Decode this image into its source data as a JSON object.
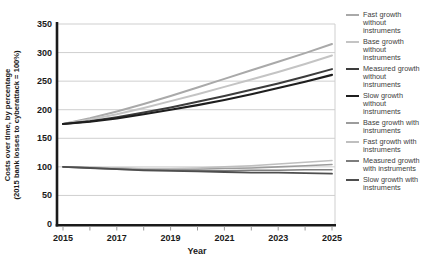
{
  "figure": {
    "background": "#ffffff",
    "axes": {
      "ylabel_line1": "Costs over time, by percentage",
      "ylabel_line2": "(2015 bank losses to cyberattack = 100%)",
      "xlabel": "Year",
      "yticks": [
        0,
        50,
        100,
        150,
        200,
        250,
        300,
        350
      ],
      "xticks": [
        2015,
        2017,
        2019,
        2021,
        2023,
        2025
      ]
    },
    "colors": {
      "axis": "#1a1a1a",
      "grid": "#cfcfcf",
      "tick": "#9a9a9a",
      "text": "#1a1a1a",
      "legend_text": "#3d3d3d"
    }
  },
  "chart_data": {
    "type": "line",
    "x": [
      2015,
      2016,
      2017,
      2018,
      2019,
      2020,
      2021,
      2022,
      2023,
      2024,
      2025
    ],
    "xlabel": "Year",
    "ylabel": "Costs over time, by percentage (2015 bank losses to cyberattack = 100%)",
    "ylim": [
      0,
      350
    ],
    "ytick_interval": 50,
    "grid": "horizontal",
    "legend_position": "right",
    "series": [
      {
        "name": "Fast growth without instruments",
        "color": "#a9a9a9",
        "width": 2,
        "values": [
          175,
          185,
          197,
          210,
          224,
          239,
          254,
          269,
          284,
          299,
          315
        ]
      },
      {
        "name": "Base growth without instruments",
        "color": "#c4c4c4",
        "width": 2,
        "values": [
          175,
          183,
          192,
          203,
          215,
          227,
          240,
          253,
          266,
          280,
          295
        ]
      },
      {
        "name": "Measured growth without instruments",
        "color": "#3c3c3c",
        "width": 2,
        "values": [
          175,
          180,
          187,
          195,
          204,
          214,
          224,
          235,
          246,
          258,
          271
        ]
      },
      {
        "name": "Slow growth without instruments",
        "color": "#1e1e1e",
        "width": 2.2,
        "values": [
          175,
          179,
          185,
          192,
          200,
          208,
          217,
          227,
          238,
          249,
          261
        ]
      },
      {
        "name": "Base growth with instruments",
        "color": "#9c9c9c",
        "width": 1.6,
        "values": [
          100,
          99,
          98,
          96,
          95,
          96,
          97,
          98,
          100,
          102,
          104
        ]
      },
      {
        "name": "Fast growth with instruments",
        "color": "#bfbfbf",
        "width": 1.6,
        "values": [
          100,
          99,
          98,
          97,
          97,
          98,
          100,
          102,
          105,
          108,
          111
        ]
      },
      {
        "name": "Measured growth with instruments",
        "color": "#7d7d7d",
        "width": 1.6,
        "values": [
          100,
          98,
          96,
          95,
          94,
          93,
          93,
          94,
          94,
          95,
          95
        ]
      },
      {
        "name": "Slow growth with instruments",
        "color": "#4e4e4e",
        "width": 1.8,
        "values": [
          100,
          98,
          96,
          94,
          93,
          92,
          91,
          90,
          90,
          89,
          88
        ]
      }
    ]
  }
}
